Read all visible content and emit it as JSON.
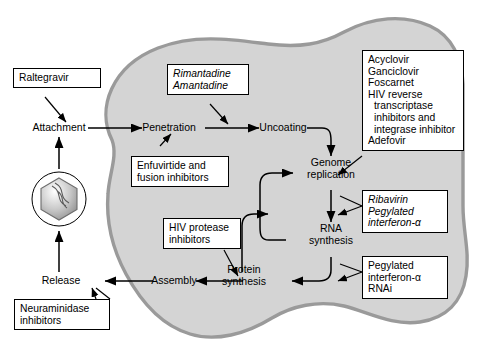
{
  "diagram": {
    "cell": {
      "fill": "#d4d4d4",
      "stroke": "#9a9a9a",
      "label": "host-cell"
    },
    "virion": {
      "label": "virus-particle"
    }
  },
  "nodes": [
    {
      "id": "attachment",
      "label": "Attachment"
    },
    {
      "id": "penetration",
      "label": "Penetration"
    },
    {
      "id": "uncoating",
      "label": "Uncoating"
    },
    {
      "id": "genome",
      "label": "Genome\nreplication"
    },
    {
      "id": "rna",
      "label": "RNA\nsynthesis"
    },
    {
      "id": "protein",
      "label": "Protein\nsynthesis"
    },
    {
      "id": "assembly",
      "label": "Assembly"
    },
    {
      "id": "release",
      "label": "Release"
    }
  ],
  "drug_boxes": [
    {
      "id": "raltegravir",
      "italic": false,
      "target": "attachment",
      "lines": [
        {
          "text": "Raltegravir",
          "indent": false
        }
      ]
    },
    {
      "id": "adamantanes",
      "italic": true,
      "target": "penetration-to-uncoating",
      "lines": [
        {
          "text": "Rimantadine",
          "indent": false
        },
        {
          "text": "Amantadine",
          "indent": false
        }
      ]
    },
    {
      "id": "fusion-inhibitors",
      "italic": false,
      "target": "penetration",
      "lines": [
        {
          "text": "Enfuvirtide and",
          "indent": false
        },
        {
          "text": "fusion inhibitors",
          "indent": false
        }
      ]
    },
    {
      "id": "genome-replication-inhibitors",
      "italic": false,
      "target": "genome",
      "lines": [
        {
          "text": "Acyclovir",
          "indent": false
        },
        {
          "text": "Ganciclovir",
          "indent": false
        },
        {
          "text": "Foscarnet",
          "indent": false
        },
        {
          "text": "HIV reverse",
          "indent": false
        },
        {
          "text": "transcriptase",
          "indent": true
        },
        {
          "text": "inhibitors and",
          "indent": true
        },
        {
          "text": "integrase inhibitor",
          "indent": true
        },
        {
          "text": "Adefovir",
          "indent": false
        }
      ]
    },
    {
      "id": "rna-synthesis-inhibitors",
      "italic": true,
      "target": "genome-to-rna",
      "lines": [
        {
          "text": "Ribavirin",
          "indent": false
        },
        {
          "text": "Pegylated",
          "indent": false
        },
        {
          "text": "interferon-α",
          "indent": false
        }
      ]
    },
    {
      "id": "protein-synthesis-inhibitors",
      "italic": false,
      "target": "protein",
      "lines": [
        {
          "text": "Pegylated",
          "indent": false
        },
        {
          "text": "interferon-α",
          "indent": false
        },
        {
          "text": "RNAi",
          "indent": false
        }
      ]
    },
    {
      "id": "hiv-protease-inhibitors",
      "italic": false,
      "target": "assembly",
      "lines": [
        {
          "text": "HIV protease",
          "indent": false
        },
        {
          "text": "inhibitors",
          "indent": false
        }
      ]
    },
    {
      "id": "neuraminidase-inhibitors",
      "italic": false,
      "target": "release",
      "lines": [
        {
          "text": "Neuraminidase",
          "indent": false
        },
        {
          "text": "inhibitors",
          "indent": false
        }
      ]
    }
  ]
}
